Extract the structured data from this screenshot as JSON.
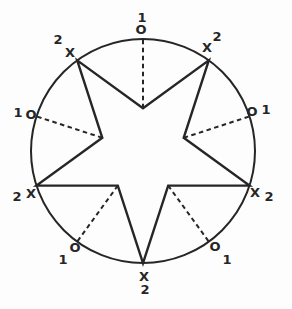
{
  "colors": {
    "ink": "#262626",
    "background": "#fdfdfd"
  },
  "points": {
    "top": {
      "mark": "O",
      "count": "1"
    },
    "upper_left": {
      "mark": "X",
      "count": "2"
    },
    "upper_right": {
      "mark": "X",
      "count": "2"
    },
    "mid_left": {
      "mark": "O",
      "count": "1"
    },
    "mid_right": {
      "mark": "O",
      "count": "1"
    },
    "left": {
      "mark": "X",
      "count": "2"
    },
    "right": {
      "mark": "X",
      "count": "2"
    },
    "lower_left": {
      "mark": "O",
      "count": "1"
    },
    "lower_right": {
      "mark": "O",
      "count": "1"
    },
    "bottom": {
      "mark": "X",
      "count": "2"
    }
  }
}
